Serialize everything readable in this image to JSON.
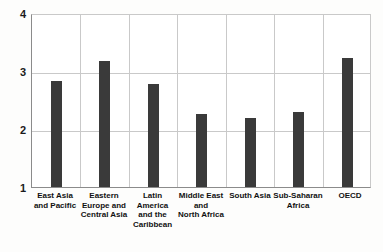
{
  "chart_data": {
    "type": "bar",
    "title": "",
    "subtitle": "",
    "xlabel": "",
    "ylabel": "",
    "ylim": [
      1,
      4
    ],
    "yticks": [
      1,
      2,
      3,
      4
    ],
    "ytick_labels": [
      "1",
      "2",
      "3",
      "4"
    ],
    "grid": true,
    "legend": false,
    "legend_position": "none",
    "categories": [
      "East Asia and Pacific",
      "Eastern Europe and Central Asia",
      "Latin America and the Caribbean",
      "Middle East and North Africa",
      "South Asia",
      "Sub-Saharan Africa",
      "OECD"
    ],
    "category_label_lines": [
      [
        "East Asia",
        "and Pacific"
      ],
      [
        "Eastern",
        "Europe and",
        "Central Asia"
      ],
      [
        "Latin",
        "America",
        "and the",
        "Caribbean"
      ],
      [
        "Middle East",
        "and",
        "North Africa"
      ],
      [
        "South Asia"
      ],
      [
        "Sub-Saharan",
        "Africa"
      ],
      [
        "OECD"
      ]
    ],
    "values": [
      2.85,
      3.2,
      2.8,
      2.28,
      2.2,
      2.3,
      3.25
    ],
    "bar_color": "#3a3a3a",
    "grid_color": "#c9c9c9",
    "axis_color": "#8b8b8b",
    "background_color": "#ffffff"
  }
}
